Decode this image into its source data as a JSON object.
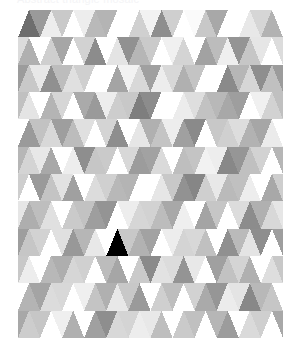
{
  "header": {
    "caption": "Abstract triangle mosaic"
  },
  "artwork": {
    "name": "triangle-mosaic",
    "title": "Low poly grayscale triangle mosaic",
    "x": 18,
    "y": 10,
    "width": 265,
    "height": 328,
    "background": "#ffffff",
    "grid": {
      "columns": 12,
      "rows": 12,
      "cell_width": 22.08,
      "cell_height": 27.33
    },
    "palette": [
      "#ffffff",
      "#fafafa",
      "#f2f2f2",
      "#ebebeb",
      "#e2e2e2",
      "#d8d8d8",
      "#cfcfcf",
      "#c4c4c4",
      "#b9b9b9",
      "#ababab",
      "#9e9e9e",
      "#919191",
      "#848484",
      "#787878",
      "#6e6e6e"
    ],
    "tones": {
      "lightest": "#ffffff",
      "light": "#ededed",
      "mid": "#c2c2c2",
      "dark": "#9a9a9a",
      "darkest": "#707070"
    },
    "rows": [
      {
        "up": [
          "#6e6e6e",
          "#ededed",
          "#ffffff",
          "#b9b9b9",
          "#ffffff",
          "#d0d0d0",
          "#8e8e8e",
          "#ffffff",
          "#c8c8c8",
          "#ffffff",
          "#e8e8e8",
          "#b2b2b2"
        ],
        "down": [
          "#ffffff",
          "#9a9a9a",
          "#c9c9c9",
          "#ededed",
          "#b4b4b4",
          "#ffffff",
          "#f2f2f2",
          "#cfcfcf",
          "#fafafa",
          "#a8a8a8",
          "#ffffff",
          "#d6d6d6"
        ]
      },
      {
        "up": [
          "#b0b0b0",
          "#cfcfcf",
          "#ffffff",
          "#8c8c8c",
          "#e4e4e4",
          "#b6b6b6",
          "#ffffff",
          "#d4d4d4",
          "#a2a2a2",
          "#efefef",
          "#c6c6c6",
          "#ffffff"
        ],
        "down": [
          "#dcdcdc",
          "#ffffff",
          "#a6a6a6",
          "#d2d2d2",
          "#ffffff",
          "#919191",
          "#cacaca",
          "#f0f0f0",
          "#ffffff",
          "#bcbcbc",
          "#949494",
          "#e6e6e6"
        ]
      },
      {
        "up": [
          "#c8c8c8",
          "#909090",
          "#e0e0e0",
          "#ffffff",
          "#a4a4a4",
          "#d8d8d8",
          "#ededed",
          "#b0b0b0",
          "#ffffff",
          "#8a8a8a",
          "#d6d6d6",
          "#c0c0c0"
        ],
        "down": [
          "#9c9c9c",
          "#e8e8e8",
          "#bdbdbd",
          "#cfcfcf",
          "#ffffff",
          "#f2f2f2",
          "#a0a0a0",
          "#d8d8d8",
          "#c4c4c4",
          "#ffffff",
          "#b6b6b6",
          "#8e8e8e"
        ]
      },
      {
        "up": [
          "#e4e4e4",
          "#b4b4b4",
          "#ffffff",
          "#9a9a9a",
          "#cdcdcd",
          "#7e7e7e",
          "#ffffff",
          "#ececec",
          "#c2c2c2",
          "#a8a8a8",
          "#ffffff",
          "#d2d2d2"
        ],
        "down": [
          "#c0c0c0",
          "#ffffff",
          "#d6d6d6",
          "#aaaaaa",
          "#ededed",
          "#c8c8c8",
          "#8c8c8c",
          "#ffffff",
          "#dedede",
          "#b8b8b8",
          "#9e9e9e",
          "#f0f0f0"
        ]
      },
      {
        "up": [
          "#9a9a9a",
          "#d8d8d8",
          "#bcbcbc",
          "#ffffff",
          "#8e8e8e",
          "#e6e6e6",
          "#c4c4c4",
          "#a0a0a0",
          "#ffffff",
          "#d0d0d0",
          "#b2b2b2",
          "#ebebeb"
        ],
        "down": [
          "#ffffff",
          "#c2c2c2",
          "#9e9e9e",
          "#e0e0e0",
          "#d4d4d4",
          "#ffffff",
          "#b0b0b0",
          "#ededed",
          "#8a8a8a",
          "#c8c8c8",
          "#dddddd",
          "#a6a6a6"
        ]
      },
      {
        "up": [
          "#d4d4d4",
          "#a8a8a8",
          "#ededed",
          "#c6c6c6",
          "#ffffff",
          "#9c9c9c",
          "#dadada",
          "#bebebe",
          "#f2f2f2",
          "#888888",
          "#c0c0c0",
          "#ffffff"
        ],
        "down": [
          "#b6b6b6",
          "#e8e8e8",
          "#ffffff",
          "#8e8e8e",
          "#cacaca",
          "#d8d8d8",
          "#a2a2a2",
          "#ffffff",
          "#c4c4c4",
          "#ededed",
          "#969696",
          "#d2d2d2"
        ]
      },
      {
        "up": [
          "#ffffff",
          "#c4c4c4",
          "#a0a0a0",
          "#dcdcdc",
          "#b8b8b8",
          "#ffffff",
          "#e6e6e6",
          "#929292",
          "#cfcfcf",
          "#bababa",
          "#ededed",
          "#a8a8a8"
        ],
        "down": [
          "#cecece",
          "#9a9a9a",
          "#e2e2e2",
          "#ffffff",
          "#d0d0d0",
          "#b4b4b4",
          "#ffffff",
          "#c8c8c8",
          "#868686",
          "#e8e8e8",
          "#c0c0c0",
          "#ffffff"
        ]
      },
      {
        "up": [
          "#aeaeae",
          "#e0e0e0",
          "#cacaca",
          "#9e9e9e",
          "#ffffff",
          "#d6d6d6",
          "#bcbcbc",
          "#efefef",
          "#a4a4a4",
          "#ffffff",
          "#8c8c8c",
          "#d8d8d8"
        ],
        "down": [
          "#e6e6e6",
          "#bebebe",
          "#ffffff",
          "#c2c2c2",
          "#949494",
          "#ededed",
          "#d2d2d2",
          "#a8a8a8",
          "#ffffff",
          "#c6c6c6",
          "#dcdcdc",
          "#b0b0b0"
        ]
      },
      {
        "up": [
          "#c6c6c6",
          "#ffffff",
          "#989898",
          "#e8e8e8",
          "#ccccccc",
          "#b2b2b2",
          "#ffffff",
          "#d4d4d4",
          "#c0c0c0",
          "#909090",
          "#e4e4e4",
          "#ffffff"
        ],
        "down": [
          "#9e9e9e",
          "#d2d2d2",
          "#e0e0e0",
          "#b6b6b6",
          "#ffffff",
          "#c8c8c8",
          "#a2a2a2",
          "#ededed",
          "#d8d8d8",
          "#ffffff",
          "#bababa",
          "#8e8e8e"
        ]
      },
      {
        "up": [
          "#ededed",
          "#b8b8b8",
          "#d6d6d6",
          "#ffffff",
          "#a6a6a6",
          "#cacaca",
          "#e2e2e2",
          "#949494",
          "#ffffff",
          "#c2c2c2",
          "#b0b0b0",
          "#dedede"
        ],
        "down": [
          "#c8c8c8",
          "#ffffff",
          "#aeaeae",
          "#d0d0d0",
          "#bcbcbc",
          "#ffffff",
          "#8a8a8a",
          "#dcdcdc",
          "#e8e8e8",
          "#a0a0a0",
          "#d4d4d4",
          "#ffffff"
        ]
      },
      {
        "up": [
          "#b4b4b4",
          "#dcdcdc",
          "#ffffff",
          "#c4c4c4",
          "#e8e8e8",
          "#9a9a9a",
          "#cfcfcf",
          "#ffffff",
          "#aaaaaa",
          "#ececec",
          "#888888",
          "#c6c6c6"
        ],
        "down": [
          "#ffffff",
          "#a4a4a4",
          "#d8d8d8",
          "#efefef",
          "#b0b0b0",
          "#c8c8c8",
          "#ffffff",
          "#bebebe",
          "#d2d2d2",
          "#969696",
          "#e4e4e4",
          "#b8b8b8"
        ]
      },
      {
        "up": [
          "#cdcdcd",
          "#ffffff",
          "#b0b0b0",
          "#a0a0a0",
          "#d8d8d8",
          "#ededed",
          "#bebebe",
          "#cacaca",
          "#ffffff",
          "#9c9c9c",
          "#dadada",
          "#ffffff"
        ],
        "down": [
          "#a8a8a8",
          "#c6c6c6",
          "#efefef",
          "#ffffff",
          "#8e8e8e",
          "#d4d4d4",
          "#e8e8e8",
          "#ffffff",
          "#c0c0c0",
          "#b6b6b6",
          "#ffffff",
          "#cfcfcf"
        ]
      }
    ]
  }
}
